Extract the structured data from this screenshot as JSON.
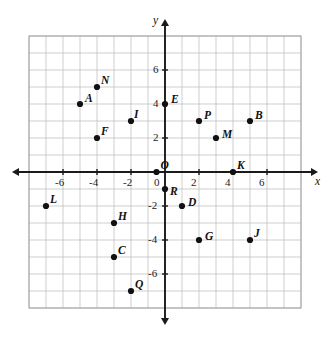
{
  "chart_data": {
    "type": "scatter",
    "title": "",
    "xlabel": "x",
    "ylabel": "y",
    "xlim": [
      -8,
      8
    ],
    "ylim": [
      -8,
      8
    ],
    "grid": true,
    "legend": "none",
    "x_tick_labels": [
      "-6",
      "-4",
      "-2",
      "0",
      "2",
      "4",
      "6"
    ],
    "x_tick_values": [
      -6,
      -4,
      -2,
      0,
      2,
      4,
      6
    ],
    "y_tick_labels": [
      "6",
      "4",
      "2",
      "0",
      "-2",
      "-4",
      "-6"
    ],
    "y_tick_values": [
      6,
      4,
      2,
      0,
      -2,
      -4,
      -6
    ],
    "points": [
      {
        "label": "N",
        "x": -4,
        "y": 5
      },
      {
        "label": "A",
        "x": -5,
        "y": 4
      },
      {
        "label": "E",
        "x": 0,
        "y": 4
      },
      {
        "label": "I",
        "x": -2,
        "y": 3
      },
      {
        "label": "P",
        "x": 2,
        "y": 3
      },
      {
        "label": "B",
        "x": 5,
        "y": 3
      },
      {
        "label": "F",
        "x": -4,
        "y": 2
      },
      {
        "label": "M",
        "x": 3,
        "y": 2
      },
      {
        "label": "O",
        "x": -0.5,
        "y": 0
      },
      {
        "label": "K",
        "x": 4,
        "y": 0
      },
      {
        "label": "R",
        "x": 0,
        "y": -1
      },
      {
        "label": "L",
        "x": -7,
        "y": -2
      },
      {
        "label": "D",
        "x": 1,
        "y": -2
      },
      {
        "label": "H",
        "x": -3,
        "y": -3
      },
      {
        "label": "G",
        "x": 2,
        "y": -4
      },
      {
        "label": "J",
        "x": 5,
        "y": -4
      },
      {
        "label": "C",
        "x": -3,
        "y": -5
      },
      {
        "label": "Q",
        "x": -2,
        "y": -7
      }
    ]
  },
  "colors": {
    "grid": "#b9b9bc",
    "axis": "#1a1a1a",
    "point": "#111111",
    "background": "#ffffff"
  }
}
